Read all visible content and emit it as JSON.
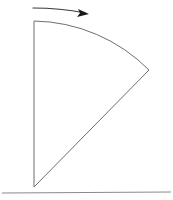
{
  "figure": {
    "title": "",
    "background_color": "#ffffff",
    "width": 173,
    "height": 200,
    "line_color": "#6e6e6e",
    "arrow_color": "#1a1a1a",
    "ground_color": "#8a8a8a"
  },
  "shapes": {
    "sector": {
      "name": "circular-sector",
      "apex": {
        "x": 34,
        "y": 187
      },
      "top_vertex": {
        "x": 34,
        "y": 21
      },
      "right_vertex": {
        "x": 149,
        "y": 70
      },
      "radius": 166,
      "arc_sweep_degrees": 45,
      "path": "M 34 187 L 34 21 A 166 166 0 0 1 149 70 Z"
    },
    "ground": {
      "name": "ground-baseline",
      "x1": 2,
      "y1": 193,
      "x2": 171,
      "y2": 192
    },
    "rotation_arrow": {
      "name": "rotation-direction-arrow",
      "direction": "right",
      "tail": {
        "x": 33,
        "y": 8
      },
      "tip": {
        "x": 89,
        "y": 14
      },
      "shaft_path": "M 33 8 Q 60 8 85 13",
      "head_path": "M 89 14 L 78 9 L 80 13 L 77 17 Z"
    }
  },
  "labels": {
    "pivot": "",
    "angle": "",
    "caption": ""
  }
}
